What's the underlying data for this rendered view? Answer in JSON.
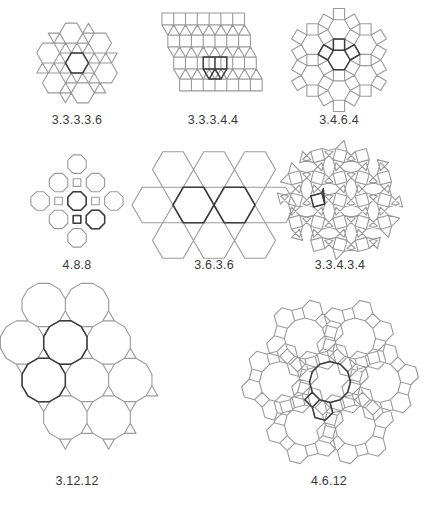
{
  "figure": {
    "stroke_color": "#9a9a9a",
    "highlight_color": "#3c3c3c",
    "label_color": "#3a3a3a",
    "background": "#ffffff"
  },
  "tilings": [
    {
      "id": "t33336",
      "label": "3.3.3.3.6",
      "kind": "snub-hexagonal",
      "center": [
        77,
        63
      ],
      "edge": 11.5,
      "label_pos": [
        77,
        122
      ]
    },
    {
      "id": "t33344",
      "label": "3.3.3.4.4",
      "kind": "elongated-triangular",
      "center": [
        215,
        63
      ],
      "edge": 11.8,
      "label_pos": [
        213,
        122
      ]
    },
    {
      "id": "t3464",
      "label": "3.4.6.4",
      "kind": "rhombitrihexagonal",
      "center": [
        339,
        60
      ],
      "edge": 11.2,
      "label_pos": [
        339,
        122
      ]
    },
    {
      "id": "t488",
      "label": "4.8.8",
      "kind": "truncated-square",
      "center": [
        77,
        201
      ],
      "edge": 10.8,
      "label_pos": [
        77,
        267
      ]
    },
    {
      "id": "t3636",
      "label": "3.6.3.6",
      "kind": "trihexagonal",
      "center": [
        214,
        205
      ],
      "edge": 20.5,
      "label_pos": [
        214,
        267
      ]
    },
    {
      "id": "t33434",
      "label": "3.3.4.3.4",
      "kind": "snub-square",
      "center": [
        340,
        200
      ],
      "edge": 11.5,
      "label_pos": [
        340,
        267
      ]
    },
    {
      "id": "t31212",
      "label": "3.12.12",
      "kind": "truncated-hexagonal",
      "center": [
        87,
        380
      ],
      "edge": 11.6,
      "label_pos": [
        77,
        483
      ]
    },
    {
      "id": "t4612",
      "label": "4.6.12",
      "kind": "truncated-trihexagonal",
      "center": [
        330,
        382
      ],
      "edge": 10.6,
      "label_pos": [
        329,
        483
      ]
    }
  ]
}
